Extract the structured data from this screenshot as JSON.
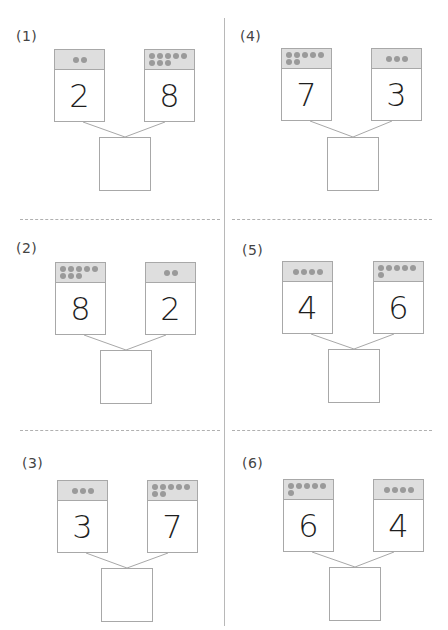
{
  "worksheet": {
    "problems": [
      {
        "label": "(1)",
        "left": 2,
        "right": 8,
        "answer": ""
      },
      {
        "label": "(2)",
        "left": 8,
        "right": 2,
        "answer": ""
      },
      {
        "label": "(3)",
        "left": 3,
        "right": 7,
        "answer": ""
      },
      {
        "label": "(4)",
        "left": 7,
        "right": 3,
        "answer": ""
      },
      {
        "label": "(5)",
        "left": 4,
        "right": 6,
        "answer": ""
      },
      {
        "label": "(6)",
        "left": 6,
        "right": 4,
        "answer": ""
      }
    ],
    "colors": {
      "card_border": "#a8a8a8",
      "card_header_bg": "#dedede",
      "dot": "#9a9a9a",
      "digit": "#1e1e1e",
      "label": "#444444",
      "divider": "#b8b8b8"
    }
  }
}
